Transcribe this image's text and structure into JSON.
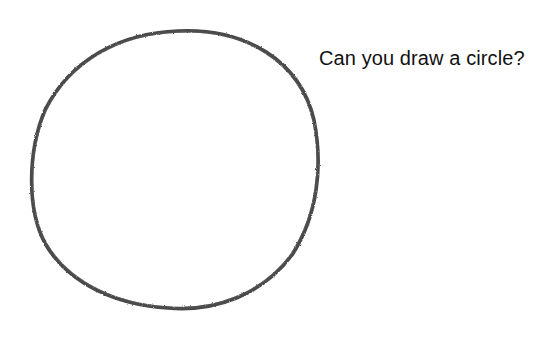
{
  "prompt": {
    "text": "Can you draw a circle?"
  },
  "drawing": {
    "shape": "hand-drawn circle",
    "stroke_color": "#3a3a3a",
    "center": [
      175,
      170
    ],
    "radius_x": 143,
    "radius_y": 140
  }
}
